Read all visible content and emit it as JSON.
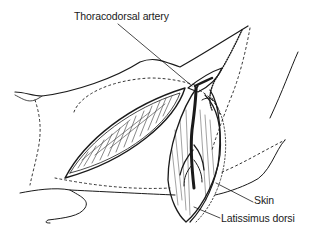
{
  "figure": {
    "type": "anatomical-line-illustration",
    "labels": {
      "artery": "Thoracodorsal artery",
      "skin": "Skin",
      "latissimus": "Latissimus dorsi"
    },
    "colors": {
      "ink": "#1a1a1a",
      "background": "#ffffff"
    }
  }
}
